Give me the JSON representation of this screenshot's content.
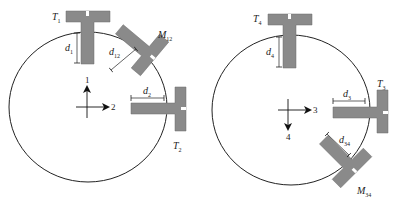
{
  "colors": {
    "sensor_fill": "#8a8a8a",
    "sensor_stroke": "#666666",
    "circle_stroke": "#222222",
    "background": "#ffffff"
  },
  "left_panel": {
    "sensors": [
      {
        "id": "T1",
        "label_main": "T",
        "label_sub": "1"
      },
      {
        "id": "M12",
        "label_main": "M",
        "label_sub": "12"
      },
      {
        "id": "T2",
        "label_main": "T",
        "label_sub": "2"
      }
    ],
    "distances": [
      {
        "id": "d1",
        "label_main": "d",
        "label_sub": "1"
      },
      {
        "id": "d12",
        "label_main": "d",
        "label_sub": "12"
      },
      {
        "id": "d2",
        "label_main": "d",
        "label_sub": "2"
      }
    ],
    "axes": {
      "up_label": "1",
      "right_label": "2"
    }
  },
  "right_panel": {
    "sensors": [
      {
        "id": "T4",
        "label_main": "T",
        "label_sub": "4"
      },
      {
        "id": "T3",
        "label_main": "T",
        "label_sub": "3"
      },
      {
        "id": "M34",
        "label_main": "M",
        "label_sub": "34"
      }
    ],
    "distances": [
      {
        "id": "d4",
        "label_main": "d",
        "label_sub": "4"
      },
      {
        "id": "d3",
        "label_main": "d",
        "label_sub": "3"
      },
      {
        "id": "d34",
        "label_main": "d",
        "label_sub": "34"
      }
    ],
    "axes": {
      "right_label": "3",
      "down_label": "4"
    }
  }
}
